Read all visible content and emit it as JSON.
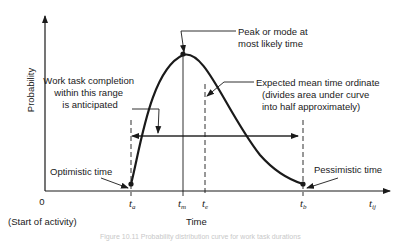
{
  "diagram": {
    "y_axis_label": "Probability",
    "x_axis_label": "Time",
    "origin_label": "0",
    "origin_note": "(Start of activity)",
    "x_ticks": [
      {
        "id": "ta",
        "base": "t",
        "sub": "a"
      },
      {
        "id": "tm",
        "base": "t",
        "sub": "m"
      },
      {
        "id": "te",
        "base": "t",
        "sub": "e"
      },
      {
        "id": "tb",
        "base": "t",
        "sub": "b"
      },
      {
        "id": "tij",
        "base": "t",
        "sub": "ij"
      }
    ],
    "annotations": {
      "peak": [
        "Peak or mode at",
        "most likely time"
      ],
      "mean": [
        "Expected mean time ordinate",
        "(divides area under curve",
        "into half approximately)"
      ],
      "range": [
        "Work task completion",
        "within this range",
        "is anticipated"
      ],
      "optimistic": "Optimistic time",
      "pessimistic": "Pessimistic time"
    },
    "caption": "Figure 10.11 Probability distribution curve for work task durations"
  }
}
